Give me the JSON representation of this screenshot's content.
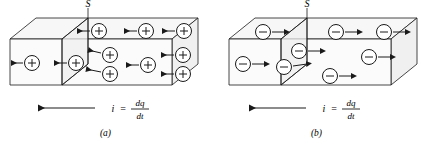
{
  "figure": {
    "type": "physics-diagram",
    "stroke_color": "#1a1a1a",
    "face_fill": "#f4f4f4",
    "background": "#ffffff"
  },
  "panels": [
    {
      "id": "a",
      "caption": "(a)",
      "plane_label": "S",
      "carrier_sign": "+",
      "carrier_count": 9,
      "drift_direction": "left",
      "current_label": {
        "symbol": "i",
        "equals": "=",
        "numerator": "dq",
        "denominator": "dt"
      },
      "current_arrow_direction": "left",
      "carriers": [
        {
          "cx": 99,
          "cy": 31,
          "arrow": "left"
        },
        {
          "cx": 146,
          "cy": 31,
          "arrow": "left"
        },
        {
          "cx": 184,
          "cy": 31,
          "arrow": "left"
        },
        {
          "cx": 32,
          "cy": 63,
          "arrow": "left"
        },
        {
          "cx": 76,
          "cy": 63,
          "arrow": "left"
        },
        {
          "cx": 110,
          "cy": 55,
          "arrow": "left"
        },
        {
          "cx": 110,
          "cy": 74,
          "arrow": "left"
        },
        {
          "cx": 148,
          "cy": 65,
          "arrow": "left"
        },
        {
          "cx": 183,
          "cy": 55,
          "arrow": "left"
        }
      ]
    },
    {
      "id": "b",
      "caption": "(b)",
      "plane_label": "S",
      "carrier_sign": "−",
      "carrier_count": 7,
      "drift_direction": "right",
      "current_label": {
        "symbol": "i",
        "equals": "=",
        "numerator": "dq",
        "denominator": "dt"
      },
      "current_arrow_direction": "left",
      "carriers": [
        {
          "cx": 52,
          "cy": 32,
          "arrow": "right"
        },
        {
          "cx": 125,
          "cy": 32,
          "arrow": "right"
        },
        {
          "cx": 173,
          "cy": 32,
          "arrow": "right"
        },
        {
          "cx": 32,
          "cy": 64,
          "arrow": "right"
        },
        {
          "cx": 88,
          "cy": 51,
          "arrow": "right"
        },
        {
          "cx": 73,
          "cy": 67,
          "arrow": "right"
        },
        {
          "cx": 158,
          "cy": 57,
          "arrow": "right"
        },
        {
          "cx": 119,
          "cy": 76,
          "arrow": "right"
        }
      ]
    }
  ]
}
